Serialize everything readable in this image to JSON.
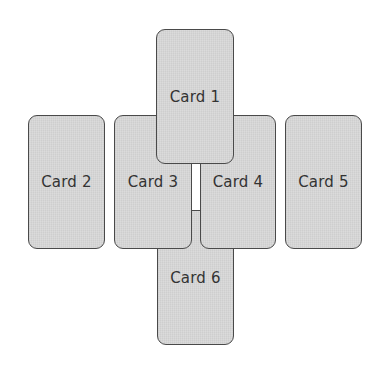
{
  "diagram": {
    "type": "card-spread-layout",
    "colors": {
      "card_fill": "#d6d6d6",
      "card_border": "#4a4a4a",
      "label": "#333333",
      "background": "#ffffff"
    },
    "cards": [
      {
        "id": "card-2",
        "label": "Card 2",
        "x": 28,
        "y": 115,
        "w": 77,
        "h": 134,
        "z": 1
      },
      {
        "id": "card-6",
        "label": "Card 6",
        "x": 157,
        "y": 210,
        "w": 77,
        "h": 135,
        "z": 1
      },
      {
        "id": "card-3",
        "label": "Card 3",
        "x": 114,
        "y": 115,
        "w": 78,
        "h": 134,
        "z": 2
      },
      {
        "id": "card-4",
        "label": "Card 4",
        "x": 200,
        "y": 115,
        "w": 76,
        "h": 134,
        "z": 2
      },
      {
        "id": "card-5",
        "label": "Card 5",
        "x": 285,
        "y": 115,
        "w": 77,
        "h": 134,
        "z": 1
      },
      {
        "id": "card-1",
        "label": "Card 1",
        "x": 156,
        "y": 29,
        "w": 78,
        "h": 135,
        "z": 3
      }
    ]
  }
}
